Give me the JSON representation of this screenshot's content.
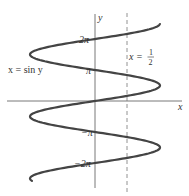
{
  "chart_data": {
    "type": "line",
    "title": "",
    "xlabel": "x",
    "ylabel": "y",
    "series": [
      {
        "name": "x = sin y",
        "equation": "x = sin(y)",
        "y_range": [
          -8.1,
          7.8
        ]
      }
    ],
    "vertical_line": {
      "label_lhs": "x =",
      "label_num": "1",
      "label_den": "2",
      "x": 0.5,
      "style": "dashed"
    },
    "y_ticks": [
      {
        "value": 6.283,
        "label": "2π"
      },
      {
        "value": 3.1416,
        "label": "π"
      },
      {
        "value": -3.1416,
        "label": "−π"
      },
      {
        "value": -6.283,
        "label": "−2π"
      }
    ],
    "curve_label": "x = sin y",
    "grid": false,
    "colors": {
      "curve": "#444444",
      "axes": "#555555",
      "dashed": "#777777",
      "text": "#333333"
    }
  }
}
